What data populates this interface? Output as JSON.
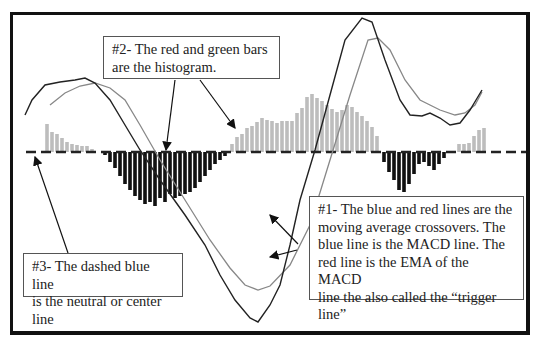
{
  "callouts": {
    "histogram": {
      "text": "#2- The red and green bars\nare the histogram."
    },
    "moving_averages": {
      "text": "#1- The blue and red lines are the\nmoving average crossovers.  The\nblue line is the MACD line.  The\nred line is the EMA of the MACD\nline the also called the “trigger\nline”"
    },
    "center_line": {
      "text": "#3- The dashed blue line\nis the neutral or center line"
    }
  },
  "colors": {
    "macd_line": "#222222",
    "signal_line": "#888888",
    "positive_bars": "#bdbdbd",
    "negative_bars": "#111111",
    "center_line": "#222222",
    "frame": "#111111"
  },
  "chart_data": {
    "type": "line",
    "center_y": 152,
    "series": [
      {
        "name": "MACD line",
        "points": [
          [
            25,
            115
          ],
          [
            32,
            100
          ],
          [
            45,
            85
          ],
          [
            60,
            82
          ],
          [
            75,
            80
          ],
          [
            85,
            78
          ],
          [
            95,
            83
          ],
          [
            110,
            100
          ],
          [
            125,
            125
          ],
          [
            140,
            150
          ],
          [
            160,
            180
          ],
          [
            185,
            215
          ],
          [
            205,
            245
          ],
          [
            220,
            275
          ],
          [
            235,
            300
          ],
          [
            250,
            318
          ],
          [
            258,
            322
          ],
          [
            270,
            305
          ],
          [
            280,
            285
          ],
          [
            290,
            245
          ],
          [
            300,
            200
          ],
          [
            315,
            150
          ],
          [
            330,
            95
          ],
          [
            345,
            40
          ],
          [
            362,
            18
          ],
          [
            372,
            22
          ],
          [
            385,
            60
          ],
          [
            400,
            100
          ],
          [
            410,
            115
          ],
          [
            422,
            116
          ],
          [
            430,
            113
          ],
          [
            440,
            118
          ],
          [
            450,
            125
          ],
          [
            460,
            123
          ],
          [
            470,
            110
          ],
          [
            476,
            100
          ],
          [
            482,
            90
          ]
        ]
      },
      {
        "name": "Signal line",
        "points": [
          [
            50,
            105
          ],
          [
            65,
            93
          ],
          [
            80,
            86
          ],
          [
            95,
            83
          ],
          [
            110,
            88
          ],
          [
            125,
            100
          ],
          [
            140,
            125
          ],
          [
            160,
            160
          ],
          [
            185,
            200
          ],
          [
            210,
            240
          ],
          [
            230,
            268
          ],
          [
            245,
            285
          ],
          [
            258,
            290
          ],
          [
            270,
            286
          ],
          [
            290,
            265
          ],
          [
            310,
            225
          ],
          [
            330,
            160
          ],
          [
            350,
            95
          ],
          [
            368,
            40
          ],
          [
            378,
            38
          ],
          [
            390,
            50
          ],
          [
            405,
            80
          ],
          [
            420,
            100
          ],
          [
            440,
            110
          ],
          [
            455,
            115
          ],
          [
            465,
            113
          ],
          [
            475,
            105
          ],
          [
            482,
            92
          ]
        ]
      }
    ],
    "histogram": [
      {
        "x": 47,
        "v": 28
      },
      {
        "x": 52,
        "v": 20
      },
      {
        "x": 57,
        "v": 18
      },
      {
        "x": 62,
        "v": 14
      },
      {
        "x": 67,
        "v": 10
      },
      {
        "x": 72,
        "v": 8
      },
      {
        "x": 77,
        "v": 7
      },
      {
        "x": 82,
        "v": 6
      },
      {
        "x": 87,
        "v": 6
      },
      {
        "x": 92,
        "v": 3
      },
      {
        "x": 105,
        "v": -3
      },
      {
        "x": 110,
        "v": -10
      },
      {
        "x": 115,
        "v": -16
      },
      {
        "x": 120,
        "v": -24
      },
      {
        "x": 125,
        "v": -32
      },
      {
        "x": 130,
        "v": -38
      },
      {
        "x": 135,
        "v": -44
      },
      {
        "x": 140,
        "v": -48
      },
      {
        "x": 145,
        "v": -52
      },
      {
        "x": 150,
        "v": -50
      },
      {
        "x": 155,
        "v": -54
      },
      {
        "x": 160,
        "v": -46
      },
      {
        "x": 165,
        "v": -50
      },
      {
        "x": 170,
        "v": -42
      },
      {
        "x": 175,
        "v": -46
      },
      {
        "x": 180,
        "v": -44
      },
      {
        "x": 185,
        "v": -42
      },
      {
        "x": 190,
        "v": -40
      },
      {
        "x": 195,
        "v": -36
      },
      {
        "x": 200,
        "v": -30
      },
      {
        "x": 205,
        "v": -24
      },
      {
        "x": 210,
        "v": -18
      },
      {
        "x": 215,
        "v": -12
      },
      {
        "x": 220,
        "v": -8
      },
      {
        "x": 225,
        "v": -4
      },
      {
        "x": 232,
        "v": 8
      },
      {
        "x": 237,
        "v": 15
      },
      {
        "x": 242,
        "v": 18
      },
      {
        "x": 247,
        "v": 24
      },
      {
        "x": 252,
        "v": 26
      },
      {
        "x": 257,
        "v": 30
      },
      {
        "x": 262,
        "v": 34
      },
      {
        "x": 267,
        "v": 32
      },
      {
        "x": 272,
        "v": 31
      },
      {
        "x": 277,
        "v": 29
      },
      {
        "x": 282,
        "v": 31
      },
      {
        "x": 287,
        "v": 31
      },
      {
        "x": 292,
        "v": 31
      },
      {
        "x": 297,
        "v": 39
      },
      {
        "x": 302,
        "v": 44
      },
      {
        "x": 307,
        "v": 55
      },
      {
        "x": 312,
        "v": 58
      },
      {
        "x": 317,
        "v": 54
      },
      {
        "x": 322,
        "v": 51
      },
      {
        "x": 327,
        "v": 47
      },
      {
        "x": 332,
        "v": 43
      },
      {
        "x": 337,
        "v": 40
      },
      {
        "x": 342,
        "v": 42
      },
      {
        "x": 347,
        "v": 47
      },
      {
        "x": 352,
        "v": 45
      },
      {
        "x": 357,
        "v": 40
      },
      {
        "x": 362,
        "v": 36
      },
      {
        "x": 367,
        "v": 31
      },
      {
        "x": 372,
        "v": 25
      },
      {
        "x": 377,
        "v": 16
      },
      {
        "x": 384,
        "v": -10
      },
      {
        "x": 389,
        "v": -20
      },
      {
        "x": 394,
        "v": -28
      },
      {
        "x": 399,
        "v": -38
      },
      {
        "x": 404,
        "v": -40
      },
      {
        "x": 409,
        "v": -32
      },
      {
        "x": 414,
        "v": -22
      },
      {
        "x": 419,
        "v": -12
      },
      {
        "x": 424,
        "v": -10
      },
      {
        "x": 429,
        "v": -14
      },
      {
        "x": 434,
        "v": -18
      },
      {
        "x": 439,
        "v": -12
      },
      {
        "x": 444,
        "v": -6
      },
      {
        "x": 459,
        "v": 8
      },
      {
        "x": 464,
        "v": 8
      },
      {
        "x": 469,
        "v": 9
      },
      {
        "x": 474,
        "v": 16
      },
      {
        "x": 479,
        "v": 22
      },
      {
        "x": 484,
        "v": 24
      }
    ]
  }
}
